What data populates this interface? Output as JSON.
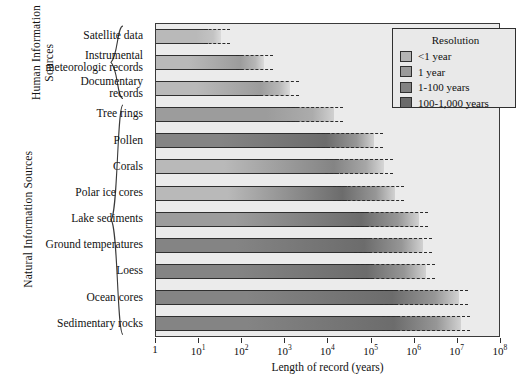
{
  "chart_data": {
    "type": "bar",
    "title": "",
    "xlabel": "Length of record (years)",
    "ylabel": "",
    "xscale": "log",
    "xlim": [
      1,
      100000000
    ],
    "xticks": [
      {
        "value": 1,
        "label": "1",
        "mantissa": "1",
        "exponent": ""
      },
      {
        "value": 10,
        "label": "10^1",
        "mantissa": "10",
        "exponent": "1"
      },
      {
        "value": 100,
        "label": "10^2",
        "mantissa": "10",
        "exponent": "2"
      },
      {
        "value": 1000,
        "label": "10^3",
        "mantissa": "10",
        "exponent": "3"
      },
      {
        "value": 10000,
        "label": "10^4",
        "mantissa": "10",
        "exponent": "4"
      },
      {
        "value": 100000,
        "label": "10^5",
        "mantissa": "10",
        "exponent": "5"
      },
      {
        "value": 1000000,
        "label": "10^6",
        "mantissa": "10",
        "exponent": "6"
      },
      {
        "value": 10000000,
        "label": "10^7",
        "mantissa": "10",
        "exponent": "7"
      },
      {
        "value": 100000000,
        "label": "10^8",
        "mantissa": "10",
        "exponent": "8"
      }
    ],
    "grid": false,
    "categories": [
      "Satellite data",
      "Instrumental meteorologic records",
      "Documentary records",
      "Tree rings",
      "Pollen",
      "Corals",
      "Polar ice cores",
      "Lake sediments",
      "Ground temperatures",
      "Loess",
      "Ocean cores",
      "Sedimentary rocks"
    ],
    "bars": [
      {
        "category": "Satellite data",
        "length_years": 32,
        "log_end": 1.5,
        "resolution_start": "<1 year",
        "resolution_end": "<1 year"
      },
      {
        "category": "Instrumental meteorologic records",
        "length_years": 320,
        "log_end": 2.5,
        "resolution_start": "<1 year",
        "resolution_end": "1 year"
      },
      {
        "category": "Documentary records",
        "length_years": 1300,
        "log_end": 3.11,
        "resolution_start": "<1 year",
        "resolution_end": "1 year"
      },
      {
        "category": "Tree rings",
        "length_years": 13000,
        "log_end": 4.12,
        "resolution_start": "1 year",
        "resolution_end": "1 year"
      },
      {
        "category": "Pollen",
        "length_years": 110000,
        "log_end": 5.05,
        "resolution_start": "1-100 years",
        "resolution_end": "100-1,000 years"
      },
      {
        "category": "Corals",
        "length_years": 200000,
        "log_end": 5.3,
        "resolution_start": "<1 year",
        "resolution_end": "1-100 years"
      },
      {
        "category": "Polar ice cores",
        "length_years": 350000,
        "log_end": 5.55,
        "resolution_start": "<1 year",
        "resolution_end": "100-1,000 years"
      },
      {
        "category": "Lake sediments",
        "length_years": 1300000,
        "log_end": 6.11,
        "resolution_start": "1 year",
        "resolution_end": "100-1,000 years"
      },
      {
        "category": "Ground temperatures",
        "length_years": 1600000,
        "log_end": 6.2,
        "resolution_start": "1-100 years",
        "resolution_end": "100-1,000 years"
      },
      {
        "category": "Loess",
        "length_years": 1800000,
        "log_end": 6.26,
        "resolution_start": "1-100 years",
        "resolution_end": "100-1,000 years"
      },
      {
        "category": "Ocean cores",
        "length_years": 10000000,
        "log_end": 7.03,
        "resolution_start": "1-100 years",
        "resolution_end": "100-1,000 years"
      },
      {
        "category": "Sedimentary rocks",
        "length_years": 11000000,
        "log_end": 7.08,
        "resolution_start": "1-100 years",
        "resolution_end": "100-1,000 years"
      }
    ],
    "legend": {
      "position": "top-right",
      "title": "Resolution",
      "entries": [
        {
          "label": "<1 year",
          "color": "#b4b4b4"
        },
        {
          "label": "1 year",
          "color": "#9a9a9a"
        },
        {
          "label": "1-100 years",
          "color": "#828282"
        },
        {
          "label": "100-1,000 years",
          "color": "#6a6a6a"
        }
      ]
    },
    "groups": [
      {
        "label": "Human Information Sources",
        "label_lines": [
          "Human Information",
          "Sources"
        ],
        "members": [
          "Satellite data",
          "Instrumental meteorologic records",
          "Documentary records"
        ]
      },
      {
        "label": "Natural Information Sources",
        "label_lines": [
          "Natural Information Sources"
        ],
        "members": [
          "Tree rings",
          "Pollen",
          "Corals",
          "Polar ice cores",
          "Lake sediments",
          "Ground temperatures",
          "Loess",
          "Ocean cores",
          "Sedimentary rocks"
        ]
      }
    ],
    "category_label_lines": [
      [
        "Satellite data"
      ],
      [
        "Instrumental",
        "meteorologic records"
      ],
      [
        "Documentary",
        "records"
      ],
      [
        "Tree rings"
      ],
      [
        "Pollen"
      ],
      [
        "Corals"
      ],
      [
        "Polar ice cores"
      ],
      [
        "Lake sediments"
      ],
      [
        "Ground temperatures"
      ],
      [
        "Loess"
      ],
      [
        "Ocean cores"
      ],
      [
        "Sedimentary rocks"
      ]
    ]
  },
  "colors": {
    "plot_background": "#ebebeb",
    "frame": "#3a3a3a",
    "text": "#111111"
  }
}
